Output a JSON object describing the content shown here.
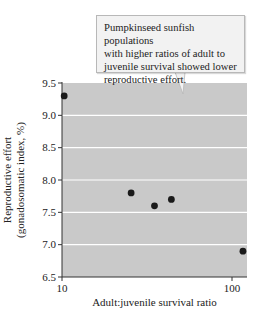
{
  "chart_data": {
    "type": "scatter",
    "title": "",
    "xlabel": "Adult:juvenile survival ratio",
    "ylabel": "Reproductive effort",
    "ylabel_sub": "(gonadosomatic index, %)",
    "xscale": "log",
    "xlim": [
      10,
      120
    ],
    "ylim": [
      6.5,
      9.5
    ],
    "xticks": [
      10,
      100
    ],
    "xtick_labels": [
      "10",
      "100"
    ],
    "yticks": [
      6.5,
      7.0,
      7.5,
      8.0,
      8.5,
      9.0,
      9.5
    ],
    "ytick_labels": [
      "6.5",
      "7.0",
      "7.5",
      "8.0",
      "8.5",
      "9.0",
      "9.5"
    ],
    "grid": "horizontal",
    "legend": null,
    "series": [
      {
        "name": "Pumpkinseed sunfish populations",
        "points": [
          {
            "x": 10.3,
            "y": 9.3
          },
          {
            "x": 25.5,
            "y": 7.8
          },
          {
            "x": 35,
            "y": 7.6
          },
          {
            "x": 44,
            "y": 7.7
          },
          {
            "x": 116,
            "y": 6.9
          }
        ]
      }
    ],
    "annotations": [
      {
        "text": "Pumpkinseed sunfish populations with higher ratios of adult to juvenile survival showed lower reproductive effort.",
        "type": "callout",
        "points_to": {
          "x": 55,
          "y": 9.35
        }
      }
    ]
  },
  "callout": {
    "lines": [
      "Pumpkinseed sunfish populations",
      "with higher ratios of adult to",
      "juvenile survival showed lower",
      "reproductive effort."
    ]
  },
  "axes": {
    "x_label": "Adult:juvenile survival ratio",
    "y_label_line1": "Reproductive effort",
    "y_label_line2": "(gonadosomatic index, %)"
  },
  "colors": {
    "plot_bg": "#c9c9c9",
    "grid": "#ffffff",
    "point": "#1a1a1a",
    "callout_bg": "#f2f2f2",
    "callout_border": "#b8b8b8"
  }
}
